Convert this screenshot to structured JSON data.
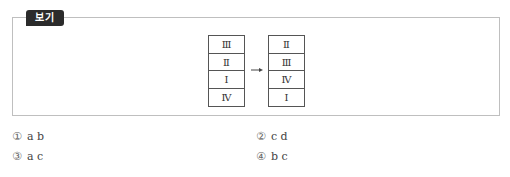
{
  "box": {
    "label": "보기",
    "before_stack": [
      "Ⅲ",
      "Ⅱ",
      "Ⅰ",
      "Ⅳ"
    ],
    "after_stack": [
      "Ⅱ",
      "Ⅲ",
      "Ⅳ",
      "Ⅰ"
    ],
    "arrow": "right-arrow"
  },
  "options": [
    {
      "num": "①",
      "text": "a b"
    },
    {
      "num": "②",
      "text": "c d"
    },
    {
      "num": "③",
      "text": "a c"
    },
    {
      "num": "④",
      "text": "b c"
    }
  ]
}
